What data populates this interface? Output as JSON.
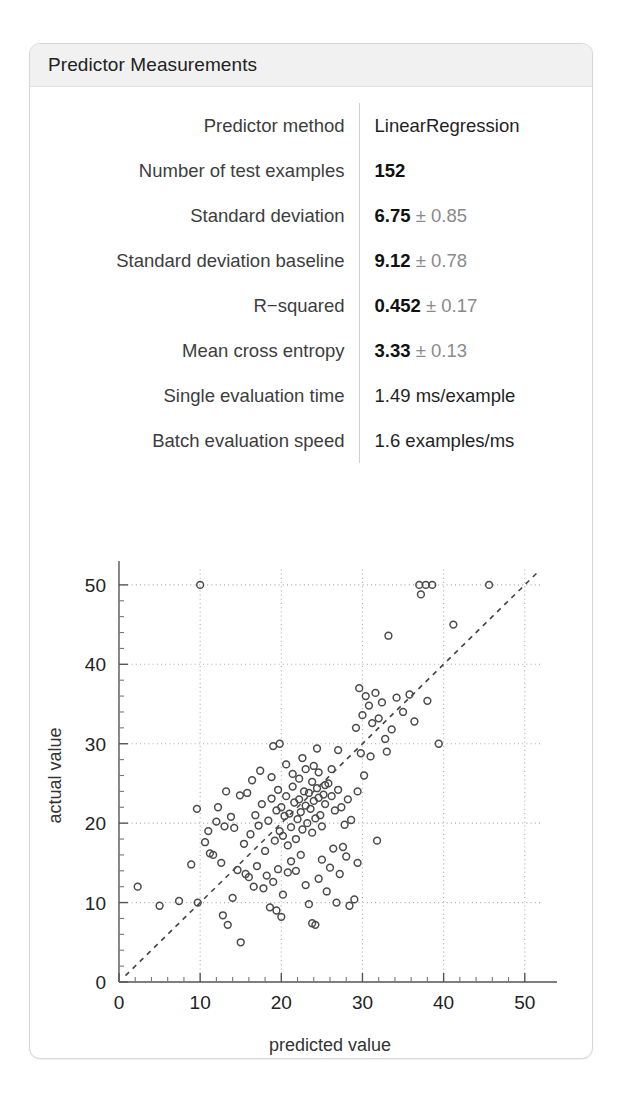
{
  "card": {
    "title": "Predictor Measurements"
  },
  "measurements": [
    {
      "label": "Predictor method",
      "value_main": "LinearRegression",
      "value_err": "",
      "bold": false
    },
    {
      "label": "Number of test examples",
      "value_main": "152",
      "value_err": "",
      "bold": true
    },
    {
      "label": "Standard deviation",
      "value_main": "6.75",
      "value_err": "± 0.85",
      "bold": true
    },
    {
      "label": "Standard deviation baseline",
      "value_main": "9.12",
      "value_err": "± 0.78",
      "bold": true
    },
    {
      "label": "R−squared",
      "value_main": "0.452",
      "value_err": "± 0.17",
      "bold": true
    },
    {
      "label": "Mean cross entropy",
      "value_main": "3.33",
      "value_err": "± 0.13",
      "bold": true
    },
    {
      "label": "Single evaluation time",
      "value_main": "1.49 ms/example",
      "value_err": "",
      "bold": false
    },
    {
      "label": "Batch evaluation speed",
      "value_main": "1.6 examples/ms",
      "value_err": "",
      "bold": false
    }
  ],
  "chart_data": {
    "type": "scatter",
    "title": "",
    "xlabel": "predicted value",
    "ylabel": "actual value",
    "xlim": [
      0,
      52
    ],
    "ylim": [
      0,
      52
    ],
    "xticks": [
      0,
      10,
      20,
      30,
      40,
      50
    ],
    "yticks": [
      0,
      10,
      20,
      30,
      40,
      50
    ],
    "minor_tick_step": 2,
    "grid": true,
    "grid_style": "dotted",
    "legend": "none",
    "reference_line": {
      "type": "identity",
      "label": "y = x",
      "style": "dashed"
    },
    "marker": {
      "shape": "circle",
      "filled": false,
      "color": "#4a4a4a",
      "radius": 3.4
    },
    "n_points": 152,
    "points": [
      [
        2.3,
        12.0
      ],
      [
        5.0,
        9.6
      ],
      [
        7.4,
        10.2
      ],
      [
        9.7,
        10.0
      ],
      [
        10.0,
        50.0
      ],
      [
        9.6,
        21.8
      ],
      [
        11.2,
        16.2
      ],
      [
        12.6,
        15.0
      ],
      [
        8.9,
        14.8
      ],
      [
        13.4,
        7.2
      ],
      [
        15.0,
        5.0
      ],
      [
        14.6,
        14.1
      ],
      [
        14.9,
        23.5
      ],
      [
        14.2,
        19.4
      ],
      [
        15.6,
        13.6
      ],
      [
        16.2,
        18.6
      ],
      [
        16.8,
        21.0
      ],
      [
        17.2,
        19.7
      ],
      [
        17.6,
        22.4
      ],
      [
        18.0,
        16.5
      ],
      [
        18.4,
        20.3
      ],
      [
        18.8,
        23.1
      ],
      [
        19.2,
        17.8
      ],
      [
        19.4,
        21.6
      ],
      [
        19.6,
        24.2
      ],
      [
        19.8,
        19.0
      ],
      [
        20.0,
        22.0
      ],
      [
        20.2,
        18.4
      ],
      [
        20.4,
        20.9
      ],
      [
        20.6,
        23.4
      ],
      [
        20.8,
        17.2
      ],
      [
        21.0,
        21.2
      ],
      [
        21.2,
        19.5
      ],
      [
        21.4,
        24.6
      ],
      [
        21.6,
        22.6
      ],
      [
        21.8,
        18.0
      ],
      [
        22.0,
        20.5
      ],
      [
        22.2,
        23.0
      ],
      [
        22.4,
        21.4
      ],
      [
        22.6,
        19.2
      ],
      [
        22.8,
        24.0
      ],
      [
        23.0,
        22.2
      ],
      [
        23.2,
        20.0
      ],
      [
        23.4,
        23.8
      ],
      [
        23.6,
        21.8
      ],
      [
        23.8,
        18.8
      ],
      [
        24.0,
        22.8
      ],
      [
        24.2,
        20.6
      ],
      [
        24.4,
        24.4
      ],
      [
        24.6,
        23.2
      ],
      [
        24.8,
        21.0
      ],
      [
        25.0,
        19.6
      ],
      [
        25.2,
        23.6
      ],
      [
        25.4,
        22.4
      ],
      [
        19.0,
        29.7
      ],
      [
        20.6,
        27.4
      ],
      [
        21.4,
        26.2
      ],
      [
        22.2,
        25.6
      ],
      [
        23.0,
        26.8
      ],
      [
        23.8,
        25.2
      ],
      [
        24.6,
        26.4
      ],
      [
        25.4,
        24.8
      ],
      [
        22.6,
        28.2
      ],
      [
        24.0,
        27.2
      ],
      [
        25.8,
        25.0
      ],
      [
        26.2,
        23.4
      ],
      [
        26.6,
        21.6
      ],
      [
        27.0,
        24.2
      ],
      [
        27.4,
        22.0
      ],
      [
        27.8,
        19.8
      ],
      [
        28.2,
        23.0
      ],
      [
        28.6,
        20.4
      ],
      [
        29.0,
        10.4
      ],
      [
        29.4,
        24.0
      ],
      [
        29.8,
        28.8
      ],
      [
        29.2,
        32.0
      ],
      [
        29.6,
        37.0
      ],
      [
        30.4,
        36.0
      ],
      [
        30.0,
        33.6
      ],
      [
        30.8,
        34.8
      ],
      [
        31.2,
        32.6
      ],
      [
        31.6,
        36.4
      ],
      [
        32.0,
        33.2
      ],
      [
        32.4,
        35.2
      ],
      [
        32.8,
        30.6
      ],
      [
        33.2,
        43.6
      ],
      [
        33.6,
        31.8
      ],
      [
        33.0,
        29.0
      ],
      [
        31.0,
        28.4
      ],
      [
        30.2,
        26.0
      ],
      [
        29.4,
        15.0
      ],
      [
        31.8,
        17.8
      ],
      [
        34.2,
        35.8
      ],
      [
        35.0,
        34.0
      ],
      [
        35.8,
        36.2
      ],
      [
        36.4,
        32.8
      ],
      [
        37.0,
        50.0
      ],
      [
        37.8,
        50.0
      ],
      [
        38.6,
        50.0
      ],
      [
        37.2,
        48.8
      ],
      [
        38.0,
        35.4
      ],
      [
        39.4,
        30.0
      ],
      [
        41.2,
        45.0
      ],
      [
        45.6,
        50.0
      ],
      [
        12.0,
        20.2
      ],
      [
        13.0,
        19.6
      ],
      [
        13.8,
        20.8
      ],
      [
        15.4,
        17.4
      ],
      [
        16.0,
        13.2
      ],
      [
        16.6,
        12.0
      ],
      [
        17.0,
        14.6
      ],
      [
        17.8,
        11.8
      ],
      [
        18.2,
        13.4
      ],
      [
        18.6,
        9.4
      ],
      [
        19.0,
        12.6
      ],
      [
        19.6,
        14.2
      ],
      [
        20.2,
        11.0
      ],
      [
        20.8,
        13.8
      ],
      [
        21.2,
        15.2
      ],
      [
        21.8,
        14.0
      ],
      [
        22.4,
        16.0
      ],
      [
        23.0,
        12.2
      ],
      [
        23.4,
        9.8
      ],
      [
        23.8,
        7.4
      ],
      [
        24.2,
        7.2
      ],
      [
        24.6,
        13.0
      ],
      [
        25.0,
        15.4
      ],
      [
        25.6,
        11.4
      ],
      [
        26.0,
        14.4
      ],
      [
        26.4,
        16.8
      ],
      [
        27.2,
        13.6
      ],
      [
        27.6,
        17.0
      ],
      [
        28.0,
        15.8
      ],
      [
        10.6,
        17.6
      ],
      [
        11.6,
        16.0
      ],
      [
        12.2,
        22.0
      ],
      [
        13.2,
        24.0
      ],
      [
        14.0,
        10.6
      ],
      [
        15.8,
        23.8
      ],
      [
        16.4,
        25.4
      ],
      [
        17.4,
        26.6
      ],
      [
        18.8,
        25.8
      ],
      [
        19.4,
        9.0
      ],
      [
        20.0,
        8.2
      ],
      [
        26.8,
        10.0
      ],
      [
        28.4,
        9.6
      ],
      [
        12.8,
        8.4
      ],
      [
        11.0,
        19.0
      ],
      [
        26.2,
        26.8
      ],
      [
        27.0,
        29.2
      ],
      [
        24.4,
        29.4
      ],
      [
        19.8,
        30.0
      ]
    ]
  }
}
